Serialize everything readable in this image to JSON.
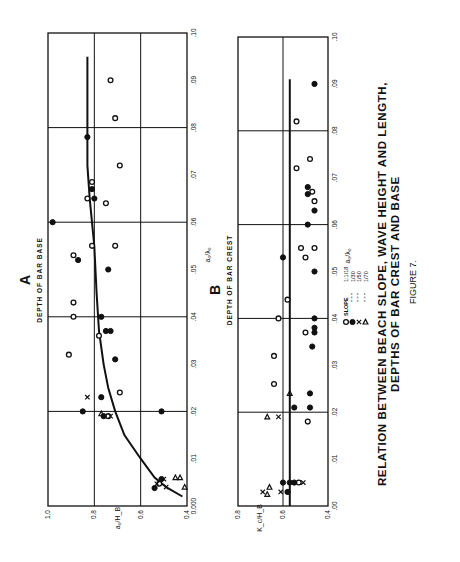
{
  "figure": {
    "caption_line1": "RELATION BETWEEN BEACH SLOPE, WAVE HEIGHT AND LENGTH,",
    "caption_line2": "DEPTHS OF BAR CREST AND BASE",
    "figure_label": "FIGURE 7."
  },
  "legend": {
    "title": "SLOPE",
    "entries": [
      {
        "marker": "open-circle",
        "label": "1:1/18"
      },
      {
        "marker": "filled-circle",
        "label": "1/30"
      },
      {
        "marker": "cross",
        "label": "1/50"
      },
      {
        "marker": "triangle",
        "label": "1/70"
      }
    ]
  },
  "chart_data": [
    {
      "type": "scatter",
      "panel": "A",
      "title": "DEPTH OF BAR BASE",
      "xlabel": "a₀/λ₀",
      "ylabel": "a₀/H_B",
      "xlim": [
        0.0,
        0.1
      ],
      "ylim": [
        0.4,
        1.0
      ],
      "x_ticks": [
        "0.000",
        ".01",
        ".02",
        ".03",
        ".04",
        ".05",
        ".06",
        ".07",
        ".08",
        ".09",
        ".10"
      ],
      "y_ticks": [
        "0.4",
        "0.6",
        "0.8",
        "1.0"
      ],
      "grid": true,
      "curve": [
        [
          0.002,
          0.42
        ],
        [
          0.004,
          0.49
        ],
        [
          0.006,
          0.54
        ],
        [
          0.01,
          0.6
        ],
        [
          0.015,
          0.67
        ],
        [
          0.02,
          0.71
        ],
        [
          0.025,
          0.74
        ],
        [
          0.03,
          0.76
        ],
        [
          0.037,
          0.78
        ],
        [
          0.045,
          0.79
        ],
        [
          0.055,
          0.8
        ],
        [
          0.065,
          0.82
        ],
        [
          0.072,
          0.83
        ],
        [
          0.095,
          0.83
        ]
      ],
      "series": [
        {
          "name": "1/18",
          "marker": "open-circle",
          "points": [
            [
              0.09,
              0.73
            ],
            [
              0.082,
              0.71
            ],
            [
              0.072,
              0.69
            ],
            [
              0.0685,
              0.81
            ],
            [
              0.065,
              0.83
            ],
            [
              0.064,
              0.75
            ],
            [
              0.055,
              0.81
            ],
            [
              0.055,
              0.71
            ],
            [
              0.053,
              0.89
            ],
            [
              0.043,
              0.89
            ],
            [
              0.04,
              0.89
            ],
            [
              0.036,
              0.78
            ],
            [
              0.032,
              0.91
            ],
            [
              0.024,
              0.69
            ],
            [
              0.019,
              0.74
            ],
            [
              0.0047,
              0.52
            ]
          ]
        },
        {
          "name": "1/30",
          "marker": "filled-circle",
          "points": [
            [
              0.078,
              0.83
            ],
            [
              0.067,
              0.81
            ],
            [
              0.065,
              0.8
            ],
            [
              0.06,
              0.98
            ],
            [
              0.052,
              0.87
            ],
            [
              0.05,
              0.74
            ],
            [
              0.04,
              0.77
            ],
            [
              0.037,
              0.75
            ],
            [
              0.037,
              0.73
            ],
            [
              0.031,
              0.71
            ],
            [
              0.023,
              0.77
            ],
            [
              0.02,
              0.85
            ],
            [
              0.02,
              0.51
            ],
            [
              0.019,
              0.76
            ],
            [
              0.0038,
              0.54
            ],
            [
              0.0057,
              0.51
            ]
          ]
        },
        {
          "name": "1/50",
          "marker": "cross",
          "points": [
            [
              0.023,
              0.83
            ],
            [
              0.019,
              0.73
            ],
            [
              0.0047,
              0.53
            ],
            [
              0.0057,
              0.5
            ],
            [
              0.004,
              0.49
            ]
          ]
        },
        {
          "name": "1/70",
          "marker": "triangle",
          "points": [
            [
              0.0195,
              0.77
            ],
            [
              0.006,
              0.45
            ],
            [
              0.006,
              0.43
            ],
            [
              0.004,
              0.41
            ]
          ]
        }
      ]
    },
    {
      "type": "scatter",
      "panel": "B",
      "title": "DEPTH OF BAR CREST",
      "xlabel": "a₀/λ₀",
      "ylabel": "K_c/H_B",
      "xlim": [
        0.0,
        0.1
      ],
      "ylim": [
        0.4,
        0.8
      ],
      "x_ticks": [
        ".00",
        ".01",
        ".02",
        ".03",
        ".04",
        ".05",
        ".06",
        ".07",
        ".08",
        ".09",
        ".10"
      ],
      "y_ticks": [
        "0.4",
        "0.6",
        "0.8"
      ],
      "grid": true,
      "curve": [
        [
          0.0,
          0.57
        ],
        [
          0.091,
          0.57
        ]
      ],
      "series": [
        {
          "name": "1/18",
          "marker": "open-circle",
          "points": [
            [
              0.082,
              0.54
            ],
            [
              0.074,
              0.48
            ],
            [
              0.072,
              0.54
            ],
            [
              0.067,
              0.47
            ],
            [
              0.065,
              0.46
            ],
            [
              0.055,
              0.52
            ],
            [
              0.055,
              0.46
            ],
            [
              0.053,
              0.5
            ],
            [
              0.044,
              0.58
            ],
            [
              0.04,
              0.62
            ],
            [
              0.037,
              0.5
            ],
            [
              0.032,
              0.64
            ],
            [
              0.026,
              0.64
            ],
            [
              0.018,
              0.49
            ],
            [
              0.005,
              0.53
            ]
          ]
        },
        {
          "name": "1/30",
          "marker": "filled-circle",
          "points": [
            [
              0.09,
              0.46
            ],
            [
              0.068,
              0.49
            ],
            [
              0.0665,
              0.49
            ],
            [
              0.063,
              0.46
            ],
            [
              0.06,
              0.49
            ],
            [
              0.053,
              0.6
            ],
            [
              0.05,
              0.46
            ],
            [
              0.04,
              0.46
            ],
            [
              0.038,
              0.46
            ],
            [
              0.037,
              0.46
            ],
            [
              0.034,
              0.47
            ],
            [
              0.024,
              0.48
            ],
            [
              0.021,
              0.55
            ],
            [
              0.021,
              0.48
            ],
            [
              0.005,
              0.6
            ],
            [
              0.005,
              0.57
            ],
            [
              0.005,
              0.55
            ],
            [
              0.003,
              0.58
            ]
          ]
        },
        {
          "name": "1/50",
          "marker": "cross",
          "points": [
            [
              0.019,
              0.62
            ],
            [
              0.005,
              0.51
            ],
            [
              0.003,
              0.69
            ],
            [
              0.003,
              0.61
            ]
          ]
        },
        {
          "name": "1/70",
          "marker": "triangle",
          "points": [
            [
              0.024,
              0.57
            ],
            [
              0.019,
              0.67
            ],
            [
              0.004,
              0.66
            ],
            [
              0.0025,
              0.67
            ]
          ]
        }
      ]
    }
  ]
}
